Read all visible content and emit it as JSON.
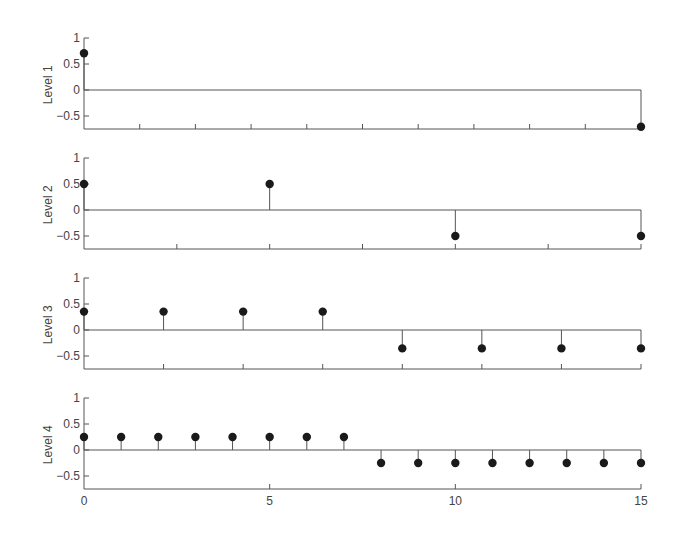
{
  "chart_data": {
    "type": "stem",
    "title": "",
    "xlabel": "",
    "x_ticks": [
      0,
      5,
      10,
      15
    ],
    "xlim": [
      0,
      15
    ],
    "ylim": [
      -0.75,
      1
    ],
    "y_ticks": [
      1,
      0.5,
      0,
      -0.5
    ],
    "y_tick_labels": [
      "1",
      "0.5",
      "0",
      "-0.5"
    ],
    "panels": [
      {
        "ylabel": "Level 1",
        "minor_ticks": 10,
        "x": [
          0,
          15
        ],
        "values": [
          0.7071,
          -0.7071
        ]
      },
      {
        "ylabel": "Level 2",
        "minor_ticks": 6,
        "x": [
          0,
          5,
          10,
          15
        ],
        "values": [
          0.5,
          0.5,
          -0.5,
          -0.5
        ]
      },
      {
        "ylabel": "Level 3",
        "minor_ticks": 7,
        "x": [
          0,
          2.143,
          4.286,
          6.429,
          8.571,
          10.714,
          12.857,
          15
        ],
        "values": [
          0.3536,
          0.3536,
          0.3536,
          0.3536,
          -0.3536,
          -0.3536,
          -0.3536,
          -0.3536
        ]
      },
      {
        "ylabel": "Level 4",
        "minor_ticks": 3,
        "x": [
          0,
          1,
          2,
          3,
          4,
          5,
          6,
          7,
          8,
          9,
          10,
          11,
          12,
          13,
          14,
          15
        ],
        "values": [
          0.25,
          0.25,
          0.25,
          0.25,
          0.25,
          0.25,
          0.25,
          0.25,
          -0.25,
          -0.25,
          -0.25,
          -0.25,
          -0.25,
          -0.25,
          -0.25,
          -0.25
        ]
      }
    ],
    "x_tick_labels": [
      "0",
      "5",
      "10",
      "15"
    ],
    "grid": false,
    "legend": null
  },
  "colors": {
    "axis": "#555555",
    "marker": "#1a1a1a",
    "text": "#444444"
  }
}
